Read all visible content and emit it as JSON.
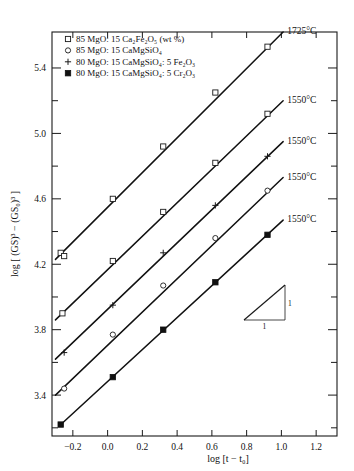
{
  "chart_data": {
    "type": "scatter",
    "title": "",
    "xlabel": "log [t − t₀]",
    "ylabel": "log [ (GS)³ − (GS₀)³ ]",
    "xlim": [
      -0.32,
      1.32
    ],
    "ylim": [
      3.15,
      5.62
    ],
    "xticks": [
      -0.2,
      0.0,
      0.2,
      0.4,
      0.6,
      0.8,
      1.0,
      1.2
    ],
    "xtick_labels": [
      "−0.2",
      "0.0",
      "0.2",
      "0.4",
      "0.6",
      "0.8",
      "1.0",
      "1.2"
    ],
    "yticks": [
      3.4,
      3.8,
      4.2,
      4.6,
      5.0,
      5.4
    ],
    "ytick_labels": [
      "3.4",
      "3.8",
      "4.2",
      "4.6",
      "5.0",
      "5.4"
    ],
    "y_minor_ticks": [
      3.2,
      3.6,
      4.0,
      4.4,
      4.8,
      5.2
    ],
    "grid": false,
    "legend_position": "top-left",
    "slope_annotation": {
      "rise": "1",
      "run": "1",
      "slope": 1.0
    },
    "series": [
      {
        "name": "85 MgO: 15 Ca₂Fe₂O₅ (wt %) — 1725°C",
        "marker": "open-square",
        "temperature": "1725°C",
        "points": [
          {
            "x": -0.27,
            "y": 4.27
          },
          {
            "x": -0.25,
            "y": 4.25
          },
          {
            "x": 0.03,
            "y": 4.6
          },
          {
            "x": 0.32,
            "y": 4.92
          },
          {
            "x": 0.62,
            "y": 5.25
          },
          {
            "x": 0.92,
            "y": 5.53
          }
        ],
        "line": [
          {
            "x": -0.3,
            "y": 4.23
          },
          {
            "x": 1.01,
            "y": 5.62
          }
        ]
      },
      {
        "name": "85 MgO: 15 Ca₂Fe₂O₅ (wt %) — 1550°C",
        "marker": "open-square",
        "temperature": "1550°C",
        "points": [
          {
            "x": -0.26,
            "y": 3.9
          },
          {
            "x": 0.03,
            "y": 4.22
          },
          {
            "x": 0.32,
            "y": 4.52
          },
          {
            "x": 0.62,
            "y": 4.82
          },
          {
            "x": 0.92,
            "y": 5.12
          }
        ],
        "line": [
          {
            "x": -0.3,
            "y": 3.86
          },
          {
            "x": 1.01,
            "y": 5.2
          }
        ]
      },
      {
        "name": "80 MgO: 15 CaMgSiO₄: 5 Fe₂O₃ — 1550°C",
        "marker": "plus",
        "temperature": "1550°C",
        "points": [
          {
            "x": -0.25,
            "y": 3.66
          },
          {
            "x": 0.03,
            "y": 3.95
          },
          {
            "x": 0.32,
            "y": 4.27
          },
          {
            "x": 0.62,
            "y": 4.56
          },
          {
            "x": 0.92,
            "y": 4.86
          }
        ],
        "line": [
          {
            "x": -0.3,
            "y": 3.62
          },
          {
            "x": 1.01,
            "y": 4.95
          }
        ]
      },
      {
        "name": "85 MgO: 15 CaMgSiO₄ — 1550°C",
        "marker": "open-circle",
        "temperature": "1550°C",
        "points": [
          {
            "x": -0.25,
            "y": 3.44
          },
          {
            "x": 0.03,
            "y": 3.77
          },
          {
            "x": 0.32,
            "y": 4.07
          },
          {
            "x": 0.62,
            "y": 4.36
          },
          {
            "x": 0.92,
            "y": 4.65
          }
        ],
        "line": [
          {
            "x": -0.3,
            "y": 3.4
          },
          {
            "x": 1.01,
            "y": 4.73
          }
        ]
      },
      {
        "name": "80 MgO: 15 CaMgSiO₄: 5 Cr₂O₃ — 1550°C",
        "marker": "filled-square",
        "temperature": "1550°C",
        "points": [
          {
            "x": -0.27,
            "y": 3.22
          },
          {
            "x": 0.03,
            "y": 3.51
          },
          {
            "x": 0.32,
            "y": 3.8
          },
          {
            "x": 0.62,
            "y": 4.09
          },
          {
            "x": 0.92,
            "y": 4.38
          }
        ],
        "line": [
          {
            "x": -0.28,
            "y": 3.21
          },
          {
            "x": 1.01,
            "y": 4.47
          }
        ]
      }
    ]
  },
  "legend": {
    "items": [
      {
        "marker": "open-square",
        "text": "85 MgO: 15 Ca₂Fe₂O₅ (wt %)"
      },
      {
        "marker": "open-circle",
        "text": "85 MgO: 15 CaMgSiO₄"
      },
      {
        "marker": "plus",
        "text": "80 MgO: 15 CaMgSiO₄: 5 Fe₂O₃"
      },
      {
        "marker": "filled-square",
        "text": "80 MgO: 15 CaMgSiO₄: 5 Cr₂O₃"
      }
    ]
  },
  "annotations": {
    "temperatures": [
      "1725°C",
      "1550°C",
      "1550°C",
      "1550°C",
      "1550°C"
    ],
    "slope_rise": "1",
    "slope_run": "1"
  },
  "axis": {
    "x_title_prefix": "log [",
    "x_title_t": "t",
    "x_title_minus": " − ",
    "x_title_t0": "t",
    "x_title_t0_sub": "0",
    "x_title_suffix": "]",
    "y_title_full": "log [ (GS)³ − (GS₀)³ ]"
  },
  "colors": {
    "axis": "#1a1a1a",
    "line": "#111111",
    "text": "#111111",
    "background": "#ffffff"
  }
}
